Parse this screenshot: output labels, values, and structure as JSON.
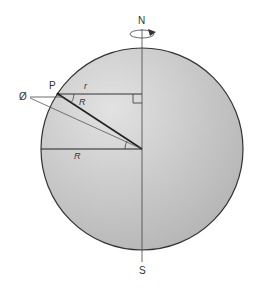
{
  "diagram": {
    "labels": {
      "north": "N",
      "south": "S",
      "point": "P",
      "latitude": "Ø",
      "small_radius": "r",
      "radius_upper": "R",
      "radius_equator": "R"
    },
    "colors": {
      "sphere_fill_light": "#d9d9d9",
      "sphere_fill_dark": "#b5b5b5",
      "stroke": "#333333"
    }
  }
}
